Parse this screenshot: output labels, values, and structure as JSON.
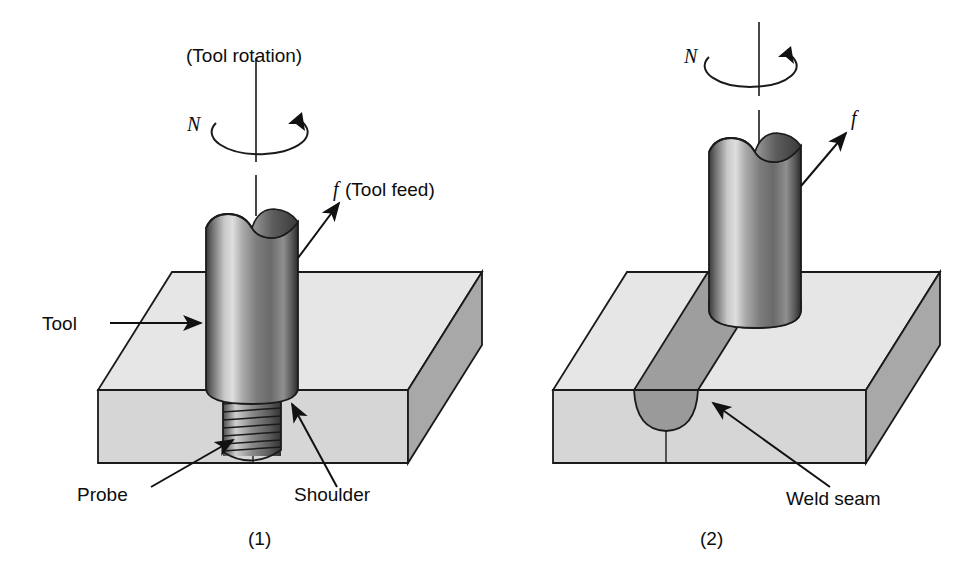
{
  "figure": {
    "type": "friction-stir-welding-process-diagram",
    "background": "#ffffff",
    "panels": [
      {
        "id": "panel-1",
        "caption": "(1)",
        "labels": {
          "tool_rotation": "(Tool rotation)",
          "rotation_symbol": "N",
          "feed_symbol": "f",
          "feed_text": "(Tool feed)",
          "tool": "Tool",
          "probe": "Probe",
          "shoulder": "Shoulder"
        }
      },
      {
        "id": "panel-2",
        "caption": "(2)",
        "labels": {
          "rotation_symbol": "N",
          "feed_symbol": "f",
          "weld_seam": "Weld seam"
        }
      }
    ],
    "colors": {
      "outline": "#1a1a1a",
      "plate_top": "#e6e6e6",
      "plate_front": "#d4d4d4",
      "plate_side": "#a8a8a8",
      "weld_top": "#9e9e9e",
      "weld_front": "#8f8f8f",
      "tool_dark": "#2e2e2e",
      "tool_mid": "#8a8a8a",
      "tool_light": "#d8d8d8"
    }
  }
}
